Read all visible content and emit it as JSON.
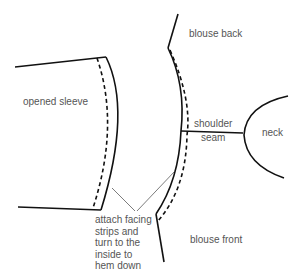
{
  "diagram": {
    "labels": {
      "opened_sleeve": "opened sleeve",
      "blouse_back": "blouse back",
      "shoulder_seam_1": "shoulder",
      "shoulder_seam_2": "seam",
      "neck": "neck",
      "blouse_front": "blouse front",
      "note_1": "attach facing",
      "note_2": "strips and",
      "note_3": "turn to the",
      "note_4": "inside to",
      "note_5": "hem down"
    },
    "colors": {
      "line": "#111111",
      "text": "#555555",
      "leader": "#444444",
      "background": "#ffffff"
    }
  }
}
